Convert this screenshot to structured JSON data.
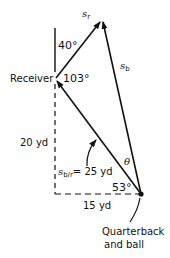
{
  "diagram": {
    "vectors": {
      "s_r": {
        "symbol": "s",
        "subscript": "r"
      },
      "s_b": {
        "symbol": "s",
        "subscript": "b"
      },
      "s_br": {
        "symbol": "s",
        "subscript": "b/r",
        "value_text": "= 25 yd"
      }
    },
    "angles": {
      "top": "40°",
      "receiver": "103°",
      "theta": "θ",
      "quarterback": "53°"
    },
    "distances": {
      "vertical": "20 yd",
      "horizontal": "15 yd"
    },
    "labels": {
      "receiver": "Receiver",
      "quarterback_line1": "Quarterback",
      "quarterback_line2": "and ball"
    }
  }
}
